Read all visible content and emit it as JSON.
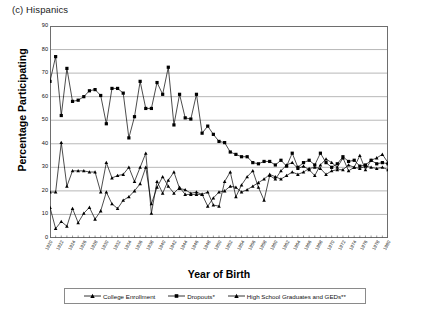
{
  "panel": {
    "label": "(c) Hispanics"
  },
  "axes": {
    "ylabel": "Percentage Participating",
    "xlabel": "Year of Birth",
    "yticks": [
      "0",
      "10",
      "20",
      "30",
      "40",
      "50",
      "60",
      "70",
      "80",
      "90"
    ],
    "ylim": [
      0,
      90
    ],
    "xlim": [
      1920,
      1980
    ],
    "xtick_step": 2
  },
  "legend": {
    "items": [
      {
        "label": "College Enrollment",
        "marker": "triangle",
        "color": "#000000"
      },
      {
        "label": "Dropouts*",
        "marker": "square",
        "color": "#000000"
      },
      {
        "label": "High School Graduates and GEDs**",
        "marker": "triangle",
        "color": "#000000"
      }
    ]
  },
  "chart_data": {
    "type": "line",
    "title": "(c) Hispanics",
    "xlabel": "Year of Birth",
    "ylabel": "Percentage Participating",
    "xlim": [
      1920,
      1980
    ],
    "ylim": [
      0,
      90
    ],
    "grid": "horizontal",
    "legend_position": "bottom",
    "x": [
      1920,
      1921,
      1922,
      1923,
      1924,
      1925,
      1926,
      1927,
      1928,
      1929,
      1930,
      1931,
      1932,
      1933,
      1934,
      1935,
      1936,
      1937,
      1938,
      1939,
      1940,
      1941,
      1942,
      1943,
      1944,
      1945,
      1946,
      1947,
      1948,
      1949,
      1950,
      1951,
      1952,
      1953,
      1954,
      1955,
      1956,
      1957,
      1958,
      1959,
      1960,
      1961,
      1962,
      1963,
      1964,
      1965,
      1966,
      1967,
      1968,
      1969,
      1970,
      1971,
      1972,
      1973,
      1974,
      1975,
      1976,
      1977,
      1978,
      1979,
      1980
    ],
    "xtick_labels": [
      "1920",
      "1922",
      "1924",
      "1926",
      "1928",
      "1930",
      "1932",
      "1934",
      "1936",
      "1938",
      "1940",
      "1942",
      "1944",
      "1946",
      "1948",
      "1950",
      "1952",
      "1954",
      "1956",
      "1958",
      "1960",
      "1962",
      "1964",
      "1966",
      "1968",
      "1970",
      "1972",
      "1974",
      "1976",
      "1978",
      "1980"
    ],
    "series": [
      {
        "name": "Dropouts*",
        "marker": "square",
        "color": "#000000",
        "values": [
          66.5,
          77,
          52,
          72,
          58,
          58.5,
          60,
          62.5,
          63,
          60.5,
          48.5,
          63.5,
          63.5,
          61.5,
          42.5,
          51.5,
          66.5,
          55,
          55,
          66,
          61,
          72.5,
          48,
          61,
          51,
          50.5,
          61,
          44.5,
          47.5,
          44,
          41,
          40.5,
          36.5,
          35.5,
          34.5,
          34.5,
          32,
          31.5,
          32.5,
          32.5,
          31,
          33,
          30.5,
          36,
          30,
          32,
          33,
          31,
          36,
          32,
          30,
          31.5,
          34.5,
          32.5,
          33,
          30.5,
          31,
          33,
          31.5,
          32,
          31.5
        ]
      },
      {
        "name": "High School Graduates and GEDs**",
        "marker": "triangle",
        "color": "#000000",
        "values": [
          19.5,
          19.5,
          40.5,
          22,
          28.5,
          28.5,
          28.5,
          28,
          28,
          19.5,
          32,
          25.5,
          26.5,
          27,
          30,
          24,
          30,
          36,
          10.5,
          24,
          19,
          24.5,
          28,
          21,
          20.5,
          19,
          19.5,
          18.5,
          19.5,
          14,
          13.5,
          24,
          28,
          17.5,
          22.5,
          26,
          28.5,
          21.5,
          16,
          26.5,
          25,
          28.5,
          31,
          32,
          29.5,
          30.5,
          29,
          26.5,
          31,
          33.5,
          32,
          30,
          34,
          28.5,
          30,
          35,
          29,
          33,
          34,
          35.5,
          32
        ]
      },
      {
        "name": "College Enrollment",
        "marker": "triangle",
        "color": "#000000",
        "values": [
          13,
          4,
          7,
          5,
          12.5,
          6.5,
          10.5,
          13,
          8,
          11.5,
          19.5,
          14.5,
          12.5,
          16,
          17.5,
          20,
          23,
          30,
          14.5,
          21.5,
          26,
          22,
          19,
          21.5,
          18.5,
          18.5,
          18.5,
          18.5,
          13.5,
          17,
          19.5,
          20,
          22,
          21.5,
          19.5,
          20.5,
          22,
          23.5,
          25,
          27,
          26,
          25,
          26.5,
          28,
          27,
          28,
          29.5,
          30,
          29.5,
          27,
          28.5,
          29,
          29,
          31,
          30,
          29.5,
          30.5,
          30,
          29.5,
          30,
          29
        ]
      }
    ]
  }
}
